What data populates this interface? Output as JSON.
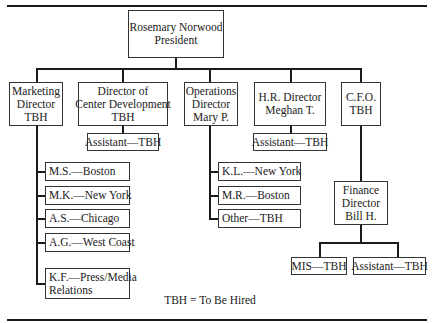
{
  "chart": {
    "president": {
      "name": "Rosemary Norwood",
      "title": "President"
    },
    "directors": [
      {
        "line1": "Marketing",
        "line2": "Director",
        "line3": "TBH"
      },
      {
        "line1": "Director of",
        "line2": "Center Development",
        "line3": "TBH"
      },
      {
        "line1": "Operations",
        "line2": "Director",
        "line3": "Mary P."
      },
      {
        "line1": "H.R. Director",
        "line2": "Meghan T."
      },
      {
        "line1": "C.F.O.",
        "line2": "TBH"
      }
    ],
    "marketing_staff": [
      {
        "label": "M.S.—Boston"
      },
      {
        "label": "M.K.—New York"
      },
      {
        "label": "A.S.—Chicago"
      },
      {
        "label": "A.G.—West Coast"
      },
      {
        "line1": "K.F.—Press/Media",
        "line2": "Relations"
      }
    ],
    "center_dev_staff": [
      {
        "label": "Assistant—TBH"
      }
    ],
    "operations_staff": [
      {
        "label": "K.L.—New York"
      },
      {
        "label": "M.R.—Boston"
      },
      {
        "label": "Other—TBH"
      }
    ],
    "hr_staff": [
      {
        "label": "Assistant—TBH"
      }
    ],
    "finance_director": {
      "line1": "Finance",
      "line2": "Director",
      "line3": "Bill H."
    },
    "finance_staff": [
      {
        "label": "MIS—TBH"
      },
      {
        "label": "Assistant—TBH"
      }
    ]
  },
  "legend": "TBH = To Be Hired"
}
